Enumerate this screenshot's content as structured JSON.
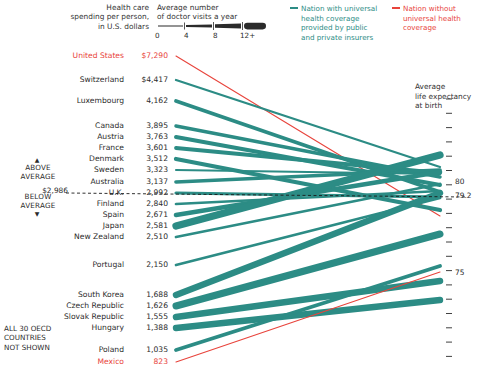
{
  "headers": {
    "spending": [
      "Health care",
      "spending per person,",
      "in U.S. dollars"
    ],
    "visits": [
      "Average number",
      "of doctor visits a year"
    ],
    "axis_right": [
      "Average",
      "life expectancy",
      "at birth"
    ]
  },
  "scale": {
    "ticks": [
      "0",
      "4",
      "8",
      "12+"
    ]
  },
  "legend": {
    "universal": [
      "Nation with universal",
      "health coverage",
      "provided by public",
      "and private insurers"
    ],
    "no_universal": [
      "Nation without",
      "universal health",
      "coverage"
    ],
    "color_universal": "#2c8c85",
    "color_no_universal": "#e8443c"
  },
  "side_notes": {
    "above": [
      "ABOVE",
      "AVERAGE"
    ],
    "below": [
      "BELOW",
      "AVERAGE"
    ],
    "average_value": "$2,986",
    "not_shown": [
      "ALL 30 OECD",
      "COUNTRIES",
      "NOT SHOWN"
    ],
    "caret_up": "▲",
    "caret_down": "▼"
  },
  "axis_right_labels": [
    {
      "value": "80",
      "y": 182
    },
    {
      "value": "79.2",
      "y": 196
    },
    {
      "value": "75",
      "y": 273
    }
  ],
  "chart_data": {
    "type": "line",
    "xlabel": "",
    "ylabel": "",
    "left_axis_label": "Health care spending per person, in U.S. dollars",
    "right_axis_label": "Average life expectancy at birth",
    "thickness_encodes": "Average number of doctor visits a year",
    "thickness_scale": {
      "min": 0,
      "max": 12,
      "unit": "visits per year"
    },
    "legend": [
      "Nation with universal health coverage provided by public and private insurers",
      "Nation without universal health coverage"
    ],
    "average_spending": 2986,
    "average_life_expectancy": 79.2,
    "right_axis_ticks": [
      80,
      79.2,
      75
    ],
    "series": [
      {
        "name": "United States",
        "spending": "$7,290",
        "spending_value": 7290,
        "life_expectancy": 78.1,
        "universal": false,
        "visits": 3.9,
        "y_left": 56,
        "y_right": 216
      },
      {
        "name": "Switzerland",
        "spending": "$4,417",
        "spending_value": 4417,
        "life_expectancy": 81.9,
        "universal": true,
        "visits": 3.4,
        "y_left": 80,
        "y_right": 167
      },
      {
        "name": "Luxembourg",
        "spending": "4,162",
        "spending_value": 4162,
        "life_expectancy": 79.4,
        "universal": true,
        "visits": 6.4,
        "y_left": 101,
        "y_right": 192
      },
      {
        "name": "Canada",
        "spending": "3,895",
        "spending_value": 3895,
        "life_expectancy": 80.7,
        "universal": true,
        "visits": 5.8,
        "y_left": 126,
        "y_right": 177
      },
      {
        "name": "Austria",
        "spending": "3,763",
        "spending_value": 3763,
        "life_expectancy": 80.1,
        "universal": true,
        "visits": 6.7,
        "y_left": 137,
        "y_right": 185
      },
      {
        "name": "France",
        "spending": "3,601",
        "spending_value": 3601,
        "life_expectancy": 81.0,
        "universal": true,
        "visits": 6.4,
        "y_left": 148,
        "y_right": 173
      },
      {
        "name": "Denmark",
        "spending": "3,512",
        "spending_value": 3512,
        "life_expectancy": 78.4,
        "universal": true,
        "visits": 7.5,
        "y_left": 159,
        "y_right": 210
      },
      {
        "name": "Sweden",
        "spending": "3,323",
        "spending_value": 3323,
        "life_expectancy": 81.0,
        "universal": true,
        "visits": 2.8,
        "y_left": 170,
        "y_right": 174
      },
      {
        "name": "Australia",
        "spending": "3,137",
        "spending_value": 3137,
        "life_expectancy": 81.4,
        "universal": true,
        "visits": 6.1,
        "y_left": 182,
        "y_right": 170
      },
      {
        "name": "U.K.",
        "spending": "2,992",
        "spending_value": 2992,
        "life_expectancy": 79.1,
        "universal": true,
        "visits": 5.1,
        "y_left": 193,
        "y_right": 197
      },
      {
        "name": "Finland",
        "spending": "2,840",
        "spending_value": 2840,
        "life_expectancy": 79.5,
        "universal": true,
        "visits": 4.2,
        "y_left": 204,
        "y_right": 191
      },
      {
        "name": "Spain",
        "spending": "2,671",
        "spending_value": 2671,
        "life_expectancy": 81.1,
        "universal": true,
        "visits": 8.1,
        "y_left": 215,
        "y_right": 172
      },
      {
        "name": "Japan",
        "spending": "2,581",
        "spending_value": 2581,
        "life_expectancy": 82.6,
        "universal": true,
        "visits": 13.6,
        "y_left": 226,
        "y_right": 155
      },
      {
        "name": "New Zealand",
        "spending": "2,510",
        "spending_value": 2510,
        "life_expectancy": 80.2,
        "universal": true,
        "visits": 4.3,
        "y_left": 237,
        "y_right": 184
      },
      {
        "name": "Portugal",
        "spending": "2,150",
        "spending_value": 2150,
        "life_expectancy": 79.1,
        "universal": true,
        "visits": 4.1,
        "y_left": 265,
        "y_right": 198
      },
      {
        "name": "South Korea",
        "spending": "1,688",
        "spending_value": 1688,
        "life_expectancy": 79.4,
        "universal": true,
        "visits": 11.8,
        "y_left": 295,
        "y_right": 193
      },
      {
        "name": "Czech Republic",
        "spending": "1,626",
        "spending_value": 1626,
        "life_expectancy": 77.0,
        "universal": true,
        "visits": 13.0,
        "y_left": 306,
        "y_right": 234
      },
      {
        "name": "Slovak Republic",
        "spending": "1,555",
        "spending_value": 1555,
        "life_expectancy": 74.3,
        "universal": true,
        "visits": 12.0,
        "y_left": 317,
        "y_right": 281
      },
      {
        "name": "Hungary",
        "spending": "1,388",
        "spending_value": 1388,
        "life_expectancy": 73.3,
        "universal": true,
        "visits": 11.8,
        "y_left": 328,
        "y_right": 300
      },
      {
        "name": "Poland",
        "spending": "1,035",
        "spending_value": 1035,
        "life_expectancy": 75.4,
        "universal": true,
        "visits": 6.6,
        "y_left": 350,
        "y_right": 266
      },
      {
        "name": "Mexico",
        "spending": "823",
        "spending_value": 823,
        "life_expectancy": 75.0,
        "universal": false,
        "visits": 2.5,
        "y_left": 362,
        "y_right": 272
      }
    ]
  }
}
